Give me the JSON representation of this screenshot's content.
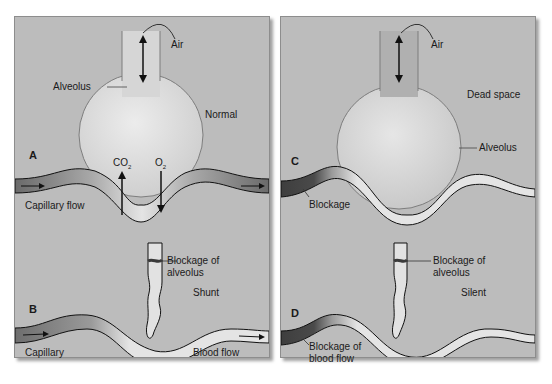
{
  "panels": {
    "A": {
      "letter": "A",
      "state": "Normal",
      "alveolus": "Alveolus",
      "air": "Air",
      "co2": "CO",
      "co2_sub": "2",
      "o2": "O",
      "o2_sub": "2",
      "flow": "Capillary flow"
    },
    "B": {
      "letter": "B",
      "state": "Shunt",
      "blockage_line1": "Blockage of",
      "blockage_line2": "alveolus",
      "capillary": "Capillary",
      "flow": "Blood flow"
    },
    "C": {
      "letter": "C",
      "state": "Dead space",
      "air": "Air",
      "alveolus": "Alveolus",
      "blockage": "Blockage"
    },
    "D": {
      "letter": "D",
      "state": "Silent",
      "blockage_line1": "Blockage of",
      "blockage_line2": "alveolus",
      "blood_line1": "Blockage of",
      "blood_line2": "blood flow"
    }
  },
  "colors": {
    "panel_bg": "#bcbcbc",
    "alveolus_fill": "#dcdcdc",
    "vessel_dark": "#6e6e6e",
    "vessel_light": "#e6e6e6",
    "outline": "#1a1a1a"
  }
}
